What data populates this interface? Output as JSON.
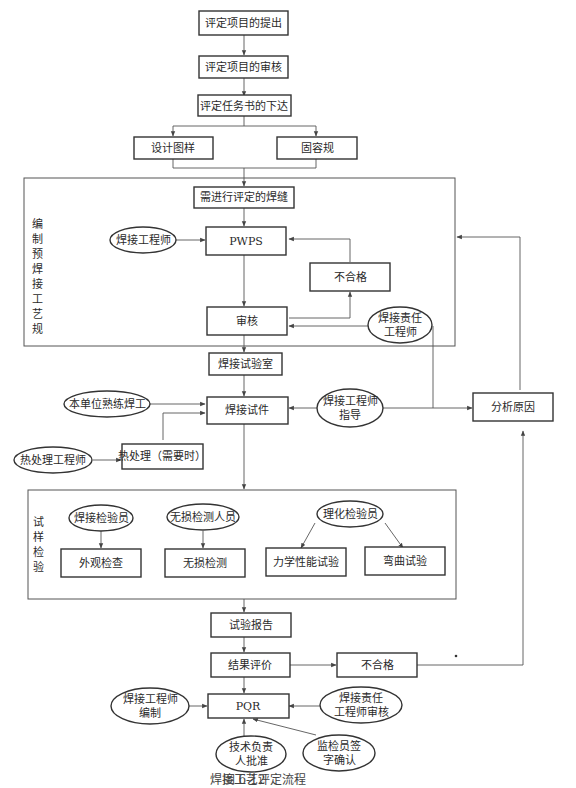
{
  "caption": {
    "figure_number": "图 6-12",
    "title": "焊接工艺评定流程"
  },
  "steps": {
    "proposal": "评定项目的提出",
    "review": "评定项目的审核",
    "task_issue": "评定任务书的下达",
    "design_drawing": "设计图样",
    "regulation": "固容规",
    "welds_to_evaluate": "需进行评定的焊缝",
    "pwps": "PWPS",
    "pwps_fail": "不合格",
    "pwps_review": "审核",
    "welding_lab": "焊接试验室",
    "test_piece": "焊接试件",
    "heat_treatment": "热处理（需要时）",
    "analyze_cause": "分析原因",
    "visual_inspection": "外观检查",
    "ndt": "无损检测",
    "mechanical_test": "力学性能试验",
    "bend_test": "弯曲试验",
    "test_report": "试验报告",
    "result_evaluation": "结果评价",
    "final_fail": "不合格",
    "pqr": "PQR"
  },
  "roles": {
    "welding_engineer": "焊接工程师",
    "responsible_engineer": [
      "焊接责任",
      "工程师"
    ],
    "skilled_welder": "本单位熟练焊工",
    "engineer_guidance": [
      "焊接工程师",
      "指导"
    ],
    "heat_treatment_engineer": "热处理工程师",
    "weld_inspector": "焊接检验员",
    "ndt_personnel": "无损检测人员",
    "physchem_inspector": "理化检验员",
    "engineer_compile": [
      "焊接工程师",
      "编制"
    ],
    "responsible_engineer_audit": [
      "焊接责任",
      "工程师审核"
    ],
    "tech_lead_approve": [
      "技术负责",
      "人批准"
    ],
    "supervisor_sign": [
      "监检员签",
      "字确认"
    ]
  },
  "groups": {
    "prepare_wps": [
      "编",
      "制",
      "预",
      "焊",
      "接",
      "工",
      "艺",
      "规",
      "程"
    ],
    "specimen_inspection": [
      "试",
      "样",
      "检",
      "验"
    ]
  }
}
